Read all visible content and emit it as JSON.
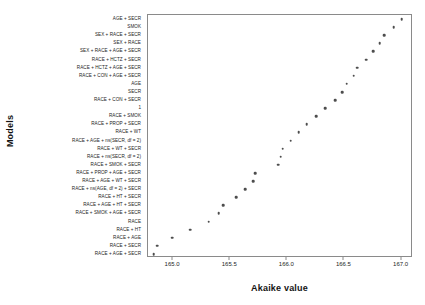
{
  "chart_data": {
    "type": "scatter",
    "title": "",
    "xlabel": "Akaike value",
    "ylabel": "Models",
    "xlim": [
      164.78,
      167.1
    ],
    "xticks": [
      165.0,
      165.5,
      166.0,
      166.5,
      167.0
    ],
    "xticklabels": [
      "165.0",
      "165.5",
      "166.0",
      "166.5",
      "167.0"
    ],
    "grid": false,
    "legend": null,
    "orientation": "horizontal-dotplot",
    "marker": "filled-circle",
    "marker_color": "#4d4d4d",
    "categories": [
      "AGE + SECR",
      "SMOK",
      "SEX + RACE + SECR",
      "SEX + RACE",
      "SEX + RACE + AGE + SECR",
      "RACE + HCTZ + SECR",
      "RACE + HCTZ + AGE + SECR",
      "RACE + CON + AGE + SECR",
      "AGE",
      "SECR",
      "RACE + CON + SECR",
      "1",
      "RACE + SMOK",
      "RACE + PROP + SECR",
      "RACE + WT",
      "RACE + AGE + ns(SECR, df = 2)",
      "RACE + WT + SECR",
      "RACE + ns(SECR, df = 2)",
      "RACE + SMOK + SECR",
      "RACE + PROP + AGE + SECR",
      "RACE + AGE + WT + SECR",
      "RACE + ns(AGE, df = 2) + SECR",
      "RACE + HT + SECR",
      "RACE + AGE + HT + SECR",
      "RACE + SMOK + AGE + SECR",
      "RACE",
      "RACE + HT",
      "RACE + AGE",
      "RACE + SECR",
      "RACE + AGE + SECR"
    ],
    "values": [
      167.0,
      166.93,
      166.85,
      166.81,
      166.75,
      166.69,
      166.61,
      166.58,
      166.52,
      166.48,
      166.42,
      166.33,
      166.25,
      166.17,
      166.1,
      166.03,
      165.96,
      165.94,
      165.92,
      165.72,
      165.7,
      165.63,
      165.55,
      165.44,
      165.4,
      165.31,
      165.15,
      164.99,
      164.86,
      164.83
    ]
  }
}
